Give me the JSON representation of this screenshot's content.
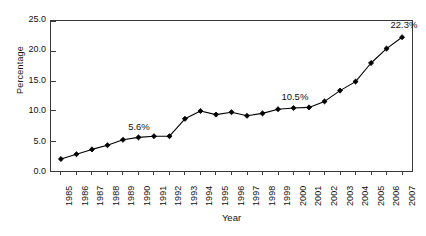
{
  "chart_data": {
    "type": "line",
    "title": "",
    "xlabel": "Year",
    "ylabel": "Percentage",
    "categories": [
      "1985",
      "1986",
      "1987",
      "1988",
      "1989",
      "1990",
      "1991",
      "1992",
      "1993",
      "1994",
      "1995",
      "1996",
      "1997",
      "1998",
      "1999",
      "2000",
      "2001",
      "2002",
      "2003",
      "2004",
      "2005",
      "2006",
      "2007"
    ],
    "values": [
      2.0,
      2.8,
      3.6,
      4.3,
      5.2,
      5.6,
      5.8,
      5.8,
      8.7,
      10.0,
      9.4,
      9.8,
      9.2,
      9.6,
      10.3,
      10.5,
      10.6,
      11.6,
      13.4,
      14.9,
      18.0,
      20.4,
      22.3
    ],
    "series": [
      {
        "name": "Percentage",
        "values": [
          2.0,
          2.8,
          3.6,
          4.3,
          5.2,
          5.6,
          5.8,
          5.8,
          8.7,
          10.0,
          9.4,
          9.8,
          9.2,
          9.6,
          10.3,
          10.5,
          10.6,
          11.6,
          13.4,
          14.9,
          18.0,
          20.4,
          22.3
        ]
      }
    ],
    "ylim": [
      0.0,
      25.0
    ],
    "ytick_labels": [
      "0.0",
      "5.0",
      "10.0",
      "15.0",
      "20.0",
      "25.0"
    ],
    "ytick_values": [
      0.0,
      5.0,
      10.0,
      15.0,
      20.0,
      25.0
    ],
    "grid": false,
    "legend": "none",
    "marker": "diamond",
    "line_color": "#000000",
    "marker_color": "#000000",
    "annotations": [
      {
        "text": "5.6%",
        "category": "1990",
        "value": 5.6
      },
      {
        "text": "10.5%",
        "category": "2000",
        "value": 10.5
      },
      {
        "text": "22.3%",
        "category": "2007",
        "value": 22.3
      }
    ]
  }
}
